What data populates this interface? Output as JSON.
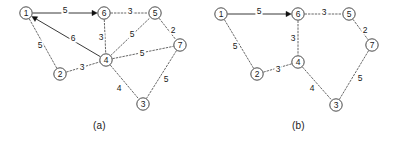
{
  "figure": {
    "panels": [
      {
        "id": "a",
        "caption": "(a)",
        "nodes": [
          {
            "id": "n1",
            "label": "1",
            "x": 26,
            "y": 13
          },
          {
            "id": "n6",
            "label": "6",
            "x": 104,
            "y": 13
          },
          {
            "id": "n5",
            "label": "5",
            "x": 155,
            "y": 13
          },
          {
            "id": "n7",
            "label": "7",
            "x": 180,
            "y": 45
          },
          {
            "id": "n4",
            "label": "4",
            "x": 106,
            "y": 60
          },
          {
            "id": "n2",
            "label": "2",
            "x": 60,
            "y": 74
          },
          {
            "id": "n3",
            "label": "3",
            "x": 143,
            "y": 104
          }
        ],
        "edges": [
          {
            "from": "n1",
            "to": "n6",
            "weight": "5",
            "style": "solid",
            "arrow": "to",
            "lx": 65,
            "ly": 10
          },
          {
            "from": "n4",
            "to": "n1",
            "weight": "6",
            "style": "solid",
            "arrow": "to",
            "lx": 73,
            "ly": 38
          },
          {
            "from": "n6",
            "to": "n5",
            "weight": "3",
            "style": "dashed",
            "arrow": "none",
            "lx": 130,
            "ly": 11
          },
          {
            "from": "n5",
            "to": "n7",
            "weight": "2",
            "style": "dashed",
            "arrow": "none",
            "lx": 173,
            "ly": 30
          },
          {
            "from": "n6",
            "to": "n4",
            "weight": "3",
            "style": "dashed",
            "arrow": "none",
            "lx": 101,
            "ly": 37
          },
          {
            "from": "n4",
            "to": "n5",
            "weight": "5",
            "style": "dashed",
            "arrow": "none",
            "lx": 132,
            "ly": 34
          },
          {
            "from": "n4",
            "to": "n7",
            "weight": "5",
            "style": "dashed",
            "arrow": "none",
            "lx": 142,
            "ly": 53
          },
          {
            "from": "n1",
            "to": "n2",
            "weight": "5",
            "style": "dashed",
            "arrow": "none",
            "lx": 40,
            "ly": 45
          },
          {
            "from": "n2",
            "to": "n4",
            "weight": "3",
            "style": "dashed",
            "arrow": "none",
            "lx": 82,
            "ly": 67
          },
          {
            "from": "n4",
            "to": "n3",
            "weight": "4",
            "style": "dashed",
            "arrow": "none",
            "lx": 119,
            "ly": 88
          },
          {
            "from": "n7",
            "to": "n3",
            "weight": "5",
            "style": "dashed",
            "arrow": "none",
            "lx": 166,
            "ly": 79
          }
        ]
      },
      {
        "id": "b",
        "caption": "(b)",
        "nodes": [
          {
            "id": "n1",
            "label": "1",
            "x": 22,
            "y": 14
          },
          {
            "id": "n6",
            "label": "6",
            "x": 99,
            "y": 14
          },
          {
            "id": "n5",
            "label": "5",
            "x": 150,
            "y": 14
          },
          {
            "id": "n7",
            "label": "7",
            "x": 173,
            "y": 45
          },
          {
            "id": "n4",
            "label": "4",
            "x": 99,
            "y": 62
          },
          {
            "id": "n2",
            "label": "2",
            "x": 58,
            "y": 74
          },
          {
            "id": "n3",
            "label": "3",
            "x": 137,
            "y": 105
          }
        ],
        "edges": [
          {
            "from": "n1",
            "to": "n6",
            "weight": "5",
            "style": "solid",
            "arrow": "to",
            "lx": 60,
            "ly": 11
          },
          {
            "from": "n6",
            "to": "n5",
            "weight": "3",
            "style": "dashed",
            "arrow": "none",
            "lx": 125,
            "ly": 12
          },
          {
            "from": "n5",
            "to": "n7",
            "weight": "2",
            "style": "dashed",
            "arrow": "none",
            "lx": 166,
            "ly": 30
          },
          {
            "from": "n6",
            "to": "n4",
            "weight": "3",
            "style": "dashed",
            "arrow": "none",
            "lx": 94,
            "ly": 38
          },
          {
            "from": "n1",
            "to": "n2",
            "weight": "5",
            "style": "dashed",
            "arrow": "none",
            "lx": 36,
            "ly": 46
          },
          {
            "from": "n2",
            "to": "n4",
            "weight": "3",
            "style": "dashed",
            "arrow": "none",
            "lx": 79,
            "ly": 69
          },
          {
            "from": "n4",
            "to": "n3",
            "weight": "4",
            "style": "dashed",
            "arrow": "none",
            "lx": 113,
            "ly": 88
          },
          {
            "from": "n7",
            "to": "n3",
            "weight": "5",
            "style": "dashed",
            "arrow": "none",
            "lx": 161,
            "ly": 78
          }
        ]
      }
    ],
    "colors": {
      "background": "#ffffff",
      "node_stroke": "#333333",
      "edge_dashed": "#555555",
      "edge_solid": "#222222",
      "text": "#1a1a1a"
    },
    "node_radius": 6.2
  }
}
